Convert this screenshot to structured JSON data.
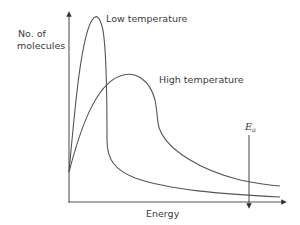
{
  "diagram": {
    "y_axis_label_line1": "No. of",
    "y_axis_label_line2": "molecules",
    "x_axis_label": "Energy",
    "curve_labels": {
      "low": "Low temperature",
      "high": "High temperature"
    },
    "activation_energy_symbol": "E",
    "activation_energy_subscript": "a",
    "colors": {
      "line": "#555555",
      "text": "#3a3a3a",
      "background": "#ffffff"
    }
  }
}
